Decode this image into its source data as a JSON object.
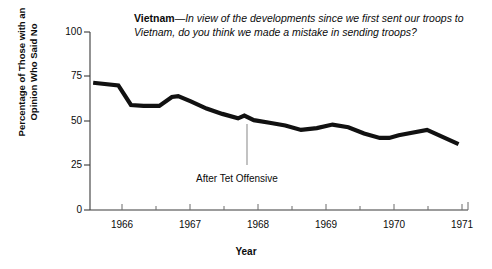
{
  "chart_data": {
    "type": "line",
    "title_lead": "Vietnam",
    "title_question": "—In view of the developments since we first sent our troops to Vietnam, do you think we made a mistake in sending troops?",
    "xlabel": "Year",
    "ylabel_line1": "Percentage of Those with an",
    "ylabel_line2": "Opinion Who Said No",
    "ylim": [
      0,
      100
    ],
    "yticks": [
      0,
      25,
      50,
      75,
      100
    ],
    "xlim": [
      1965.6,
      1971.6
    ],
    "xticks": [
      1966,
      1967,
      1968,
      1969,
      1970,
      1971
    ],
    "xticklabels": [
      "1966",
      "1967",
      "1968",
      "1969",
      "1970",
      "1971"
    ],
    "grid": false,
    "legend": false,
    "line_color": "#111111",
    "annotations": [
      {
        "text": "After Tet Offensive",
        "x": 1968.1,
        "y": 25,
        "leader_from_y": 48,
        "leader_to_y": 28
      }
    ],
    "series": [
      {
        "name": "Percentage saying No (not a mistake)",
        "x": [
          1965.65,
          1966.05,
          1966.25,
          1966.45,
          1966.7,
          1966.9,
          1967.0,
          1967.2,
          1967.45,
          1967.7,
          1967.95,
          1968.05,
          1968.2,
          1968.45,
          1968.7,
          1968.95,
          1969.2,
          1969.45,
          1969.7,
          1969.95,
          1970.2,
          1970.35,
          1970.5,
          1970.95,
          1971.45
        ],
        "y": [
          71.5,
          70.0,
          59.0,
          58.5,
          58.5,
          63.5,
          64.0,
          61.0,
          57.0,
          54.0,
          51.5,
          53.0,
          50.5,
          49.0,
          47.5,
          45.0,
          46.0,
          48.0,
          46.5,
          43.0,
          40.5,
          40.5,
          42.0,
          45.0,
          37.0
        ]
      }
    ]
  }
}
